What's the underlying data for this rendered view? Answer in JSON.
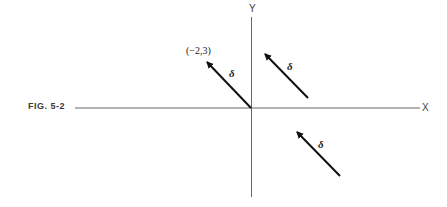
{
  "figure": {
    "label": "FIG. 5-2"
  },
  "axes": {
    "x_label": "X",
    "y_label": "Y",
    "color": "#555555"
  },
  "point": {
    "label": "(−2,3)"
  },
  "vectors": [
    {
      "name": "δ",
      "label": "δ",
      "from": "origin",
      "to": "(−2,3)"
    },
    {
      "name": "δ",
      "label": "δ",
      "from": "first quadrant",
      "to": "translated"
    },
    {
      "name": "δ",
      "label": "δ",
      "from": "fourth quadrant",
      "to": "translated"
    }
  ],
  "colors": {
    "arrow": "#111111",
    "background": "#ffffff"
  }
}
